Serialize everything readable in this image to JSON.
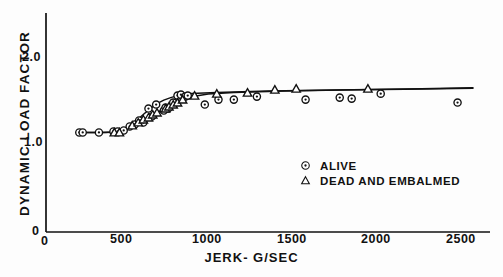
{
  "chart_data": {
    "type": "scatter",
    "title": "",
    "xlabel": "JERK- G/SEC",
    "ylabel": "DYNAMIC LOAD FACTOR",
    "xlim": [
      0,
      2600
    ],
    "ylim": [
      0,
      2.2
    ],
    "xticks": [
      0,
      500,
      1000,
      1500,
      2000,
      2500
    ],
    "xtick_labels": [
      "0",
      "500",
      "1000",
      "1500",
      "2000",
      "2500"
    ],
    "yticks": [
      0,
      1.0,
      2.0
    ],
    "ytick_labels": [
      "0",
      "1.0",
      "2.0"
    ],
    "grid": false,
    "legend_position": "center-right",
    "series": [
      {
        "name": "ALIVE",
        "marker": "circle-dot",
        "points": [
          [
            195,
            1.0
          ],
          [
            215,
            1.0
          ],
          [
            310,
            1.0
          ],
          [
            395,
            1.01
          ],
          [
            420,
            1.01
          ],
          [
            455,
            1.02
          ],
          [
            490,
            1.06
          ],
          [
            520,
            1.08
          ],
          [
            545,
            1.12
          ],
          [
            570,
            1.1
          ],
          [
            600,
            1.24
          ],
          [
            620,
            1.16
          ],
          [
            645,
            1.28
          ],
          [
            690,
            1.22
          ],
          [
            700,
            1.25
          ],
          [
            715,
            1.24
          ],
          [
            745,
            1.3
          ],
          [
            770,
            1.37
          ],
          [
            790,
            1.38
          ],
          [
            815,
            1.36
          ],
          [
            830,
            1.37
          ],
          [
            930,
            1.28
          ],
          [
            1010,
            1.33
          ],
          [
            1100,
            1.33
          ],
          [
            1235,
            1.36
          ],
          [
            1520,
            1.33
          ],
          [
            1720,
            1.35
          ],
          [
            1790,
            1.34
          ],
          [
            1960,
            1.39
          ],
          [
            2410,
            1.3
          ]
        ]
      },
      {
        "name": "DEAD AND EMBALMED",
        "marker": "triangle",
        "points": [
          [
            400,
            1.0
          ],
          [
            430,
            1.0
          ],
          [
            505,
            1.07
          ],
          [
            540,
            1.1
          ],
          [
            570,
            1.13
          ],
          [
            600,
            1.15
          ],
          [
            625,
            1.18
          ],
          [
            650,
            1.2
          ],
          [
            700,
            1.24
          ],
          [
            720,
            1.26
          ],
          [
            745,
            1.28
          ],
          [
            770,
            1.3
          ],
          [
            800,
            1.33
          ],
          [
            870,
            1.37
          ],
          [
            1000,
            1.39
          ],
          [
            1180,
            1.4
          ],
          [
            1340,
            1.43
          ],
          [
            1465,
            1.44
          ],
          [
            1885,
            1.44
          ]
        ]
      }
    ],
    "fit_curves": [
      {
        "name": "alive-fit",
        "points": [
          [
            180,
            1.0
          ],
          [
            320,
            1.0
          ],
          [
            400,
            1.005
          ],
          [
            450,
            1.02
          ],
          [
            490,
            1.06
          ],
          [
            530,
            1.12
          ],
          [
            570,
            1.18
          ],
          [
            610,
            1.24
          ],
          [
            650,
            1.29
          ],
          [
            690,
            1.325
          ],
          [
            730,
            1.35
          ],
          [
            780,
            1.375
          ],
          [
            850,
            1.39
          ],
          [
            1000,
            1.4
          ],
          [
            1300,
            1.415
          ],
          [
            1700,
            1.425
          ],
          [
            2100,
            1.435
          ],
          [
            2500,
            1.445
          ]
        ]
      },
      {
        "name": "dead-embalmed-fit",
        "points": [
          [
            180,
            1.0
          ],
          [
            350,
            1.0
          ],
          [
            420,
            1.005
          ],
          [
            470,
            1.03
          ],
          [
            510,
            1.07
          ],
          [
            550,
            1.11
          ],
          [
            600,
            1.155
          ],
          [
            650,
            1.2
          ],
          [
            700,
            1.245
          ],
          [
            750,
            1.285
          ],
          [
            800,
            1.325
          ],
          [
            860,
            1.36
          ],
          [
            950,
            1.385
          ],
          [
            1100,
            1.4
          ],
          [
            1400,
            1.415
          ],
          [
            1800,
            1.43
          ],
          [
            2200,
            1.44
          ],
          [
            2500,
            1.45
          ]
        ]
      }
    ]
  },
  "axis": {
    "y_tick_2": "2.0",
    "y_tick_1": "1.0",
    "y_tick_0": "0",
    "x_tick_0": "0",
    "x_tick_500": "500",
    "x_tick_1000": "1000",
    "x_tick_1500": "1500",
    "x_tick_2000": "2000",
    "x_tick_2500": "2500",
    "x_axis_title": "JERK- G/SEC",
    "y_axis_title": "DYNAMIC LOAD FACTOR"
  },
  "legend": {
    "alive_label": "ALIVE",
    "dead_label": "DEAD AND EMBALMED"
  },
  "colors": {
    "ink": "#111111",
    "background": "#fdfdfd"
  }
}
